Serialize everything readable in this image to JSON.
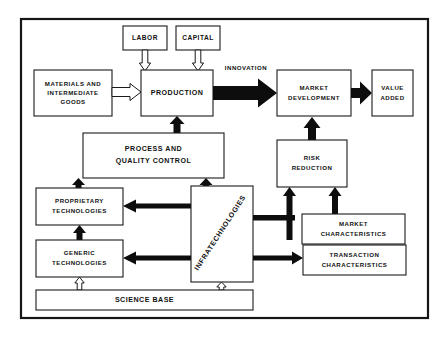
{
  "diagram": {
    "frame": {
      "name": "outer-frame"
    },
    "colors": {
      "background": "#ffffff",
      "box_fill": "#ffffff",
      "box_stroke": "#1a1a1a",
      "solid_arrow": "#0d0d0d",
      "hollow_arrow_fill": "#ffffff",
      "text": "#111111"
    },
    "nodes": [
      {
        "id": "labor",
        "label": "LABOR",
        "lines": [
          "LABOR"
        ]
      },
      {
        "id": "capital",
        "label": "CAPITAL",
        "lines": [
          "CAPITAL"
        ]
      },
      {
        "id": "materials",
        "label": "MATERIALS AND INTERMEDIATE GOODS",
        "lines": [
          "MATERIALS AND",
          "INTERMEDIATE",
          "GOODS"
        ]
      },
      {
        "id": "production",
        "label": "PRODUCTION",
        "lines": [
          "PRODUCTION"
        ]
      },
      {
        "id": "market_development",
        "label": "MARKET DEVELOPMENT",
        "lines": [
          "MARKET",
          "DEVELOPMENT"
        ]
      },
      {
        "id": "value_added",
        "label": "VALUE ADDED",
        "lines": [
          "VALUE",
          "ADDED"
        ]
      },
      {
        "id": "process_quality",
        "label": "PROCESS AND QUALITY CONTROL",
        "lines": [
          "PROCESS  AND",
          "QUALITY  CONTROL"
        ]
      },
      {
        "id": "risk_reduction",
        "label": "RISK REDUCTION",
        "lines": [
          "RISK",
          "REDUCTION"
        ]
      },
      {
        "id": "proprietary",
        "label": "PROPRIETARY TECHNOLOGIES",
        "lines": [
          "PROPRIETARY",
          "TECHNOLOGIES"
        ]
      },
      {
        "id": "generic",
        "label": "GENERIC TECHNOLOGIES",
        "lines": [
          "GENERIC",
          "TECHNOLOGIES"
        ]
      },
      {
        "id": "infratechnologies",
        "label": "INFRATECHNOLOGIES",
        "lines": [
          "INFRATECHNOLOGIES"
        ]
      },
      {
        "id": "market_characteristics",
        "label": "MARKET CHARACTERISTICS",
        "lines": [
          "MARKET",
          "CHARACTERISTICS"
        ]
      },
      {
        "id": "transaction_characteristics",
        "label": "TRANSACTION CHARACTERISTICS",
        "lines": [
          "TRANSACTION",
          "CHARACTERISTICS"
        ]
      },
      {
        "id": "science_base",
        "label": "SCIENCE BASE",
        "lines": [
          "SCIENCE  BASE"
        ]
      }
    ],
    "edge_labels": [
      {
        "id": "innovation",
        "label": "INNOVATION"
      }
    ],
    "edges": [
      {
        "from": "labor",
        "to": "production",
        "style": "hollow"
      },
      {
        "from": "capital",
        "to": "production",
        "style": "hollow"
      },
      {
        "from": "materials",
        "to": "production",
        "style": "hollow"
      },
      {
        "from": "production",
        "to": "market_development",
        "style": "solid",
        "label": "INNOVATION"
      },
      {
        "from": "market_development",
        "to": "value_added",
        "style": "solid"
      },
      {
        "from": "process_quality",
        "to": "production",
        "style": "solid"
      },
      {
        "from": "risk_reduction",
        "to": "market_development",
        "style": "solid"
      },
      {
        "from": "proprietary",
        "to": "process_quality",
        "style": "solid"
      },
      {
        "from": "infratechnologies",
        "to": "process_quality",
        "style": "solid"
      },
      {
        "from": "infratechnologies",
        "to": "proprietary",
        "style": "solid"
      },
      {
        "from": "infratechnologies",
        "to": "generic",
        "style": "solid"
      },
      {
        "from": "generic",
        "to": "proprietary",
        "style": "solid"
      },
      {
        "from": "infratechnologies",
        "to": "risk_reduction",
        "style": "solid"
      },
      {
        "from": "infratechnologies",
        "to": "transaction_characteristics",
        "style": "solid"
      },
      {
        "from": "market_characteristics",
        "to": "risk_reduction",
        "style": "solid"
      },
      {
        "from": "science_base",
        "to": "generic",
        "style": "hollow"
      },
      {
        "from": "science_base",
        "to": "infratechnologies",
        "style": "hollow"
      }
    ]
  }
}
